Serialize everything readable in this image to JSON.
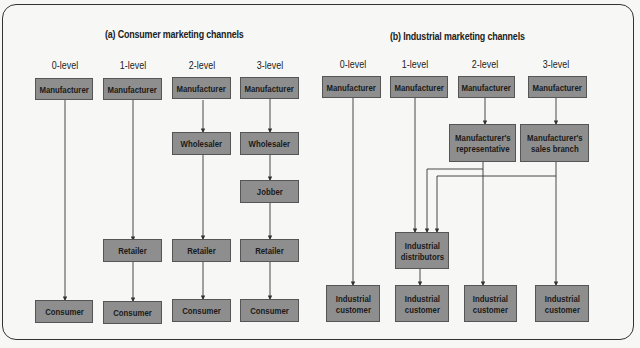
{
  "consumer": {
    "title": "(a) Consumer marketing channels",
    "levels": [
      "0-level",
      "1-level",
      "2-level",
      "3-level"
    ],
    "nodes": {
      "manufacturer": "Manufacturer",
      "wholesaler": "Wholesaler",
      "jobber": "Jobber",
      "retailer": "Retailer",
      "consumer": "Consumer"
    }
  },
  "industrial": {
    "title": "(b) Industrial marketing channels",
    "levels": [
      "0-level",
      "1-level",
      "2-level",
      "3-level"
    ],
    "nodes": {
      "manufacturer": "Manufacturer",
      "representative": "Manufacturer's\nrepresentative",
      "sales_branch": "Manufacturer's\nsales branch",
      "distributors": "Industrial\ndistributors",
      "customer": "Industrial\ncustomer"
    }
  },
  "colors": {
    "box_fill": "#8e8e8e",
    "box_border": "#555555",
    "line": "#333333"
  }
}
